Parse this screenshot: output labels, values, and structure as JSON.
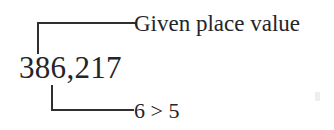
{
  "figure": {
    "background_color": "#ffffff",
    "ink_color": "#2a2a2a",
    "number": "386,217",
    "annotations": {
      "top": {
        "label": "Given place value",
        "leader_shape": "corner-up-right"
      },
      "bottom": {
        "label": "6 > 5",
        "leader_shape": "corner-down-right"
      }
    }
  }
}
